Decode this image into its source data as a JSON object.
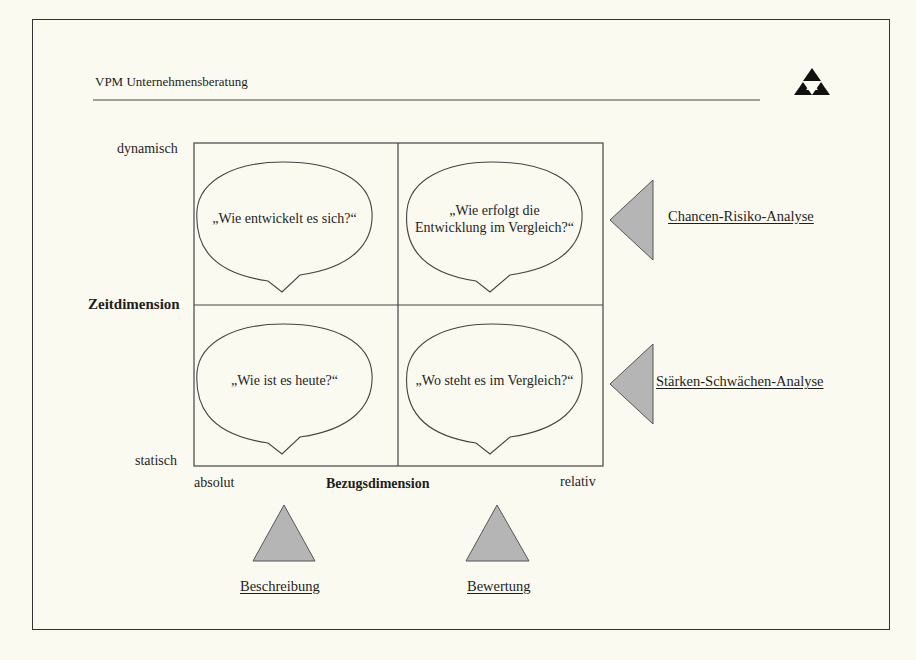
{
  "header": {
    "title": "VPM Unternehmensberatung",
    "logo": "triangle-pyramid-logo"
  },
  "matrix": {
    "y_axis": {
      "label": "Zeitdimension",
      "top": "dynamisch",
      "bottom": "statisch"
    },
    "x_axis": {
      "label": "Bezugsdimension",
      "left": "absolut",
      "right": "relativ"
    },
    "quadrants": {
      "top_left": "„Wie entwickelt es sich?“",
      "top_right_line1": "„Wie erfolgt die",
      "top_right_line2": "Entwicklung im Vergleich?“",
      "bottom_left": "„Wie ist es heute?“",
      "bottom_right": "„Wo steht es im Vergleich?“"
    }
  },
  "analyses": {
    "right_top": "Chancen-Risiko-Analyse",
    "right_bottom": "Stärken-Schwächen-Analyse",
    "bottom_left": "Beschreibung",
    "bottom_right": "Bewertung"
  },
  "colors": {
    "triangle_fill": "#b5b5b5",
    "line": "#444444",
    "background": "#fbfaf1"
  }
}
